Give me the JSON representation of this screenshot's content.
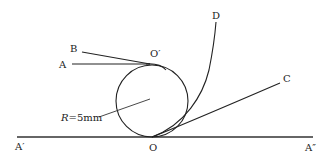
{
  "diagram": {
    "type": "geometry-figure",
    "colors": {
      "stroke": "#222222",
      "background": "#ffffff"
    },
    "labels": {
      "A": "A",
      "B": "B",
      "C": "C",
      "D": "D",
      "O": "O",
      "O_prime": "O′",
      "A_prime": "A′",
      "A_double_prime": "A″",
      "radius_var": "R",
      "radius_value": "=5mm"
    },
    "elements": [
      {
        "id": "baseline",
        "from": "A′",
        "to": "A″",
        "kind": "line"
      },
      {
        "id": "circle",
        "center_label": "R=5mm",
        "tangent_points": [
          "O",
          "O′"
        ],
        "kind": "circle"
      },
      {
        "id": "line-A",
        "from": "A",
        "to": "O′",
        "kind": "line"
      },
      {
        "id": "line-B",
        "from": "B",
        "to": "O′",
        "kind": "line"
      },
      {
        "id": "curve-D",
        "from": "O",
        "to": "D",
        "kind": "curve"
      },
      {
        "id": "line-C",
        "from": "O",
        "to": "C",
        "kind": "line"
      }
    ]
  }
}
